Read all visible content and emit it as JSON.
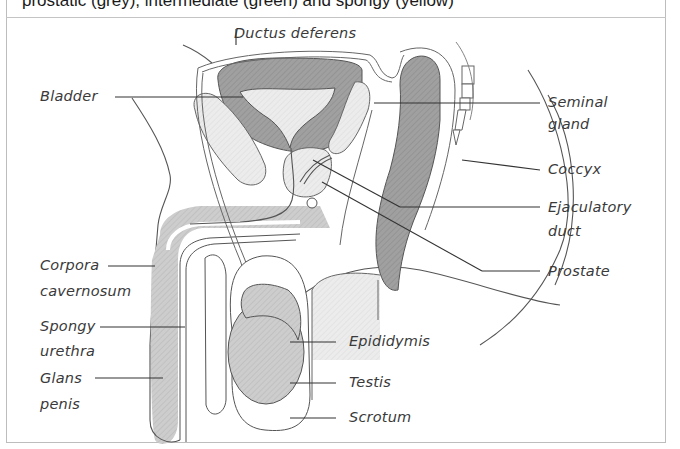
{
  "caption": "prostatic (grey), intermediate (green) and spongy (yellow)",
  "colors": {
    "stroke": "#4a4a4a",
    "dark_fill": "#9a9a9a",
    "mid_fill": "#c8c8c8",
    "light_fill": "#e4e4e4",
    "border": "#bdbdbd"
  },
  "labels": {
    "ductus_deferens": "Ductus deferens",
    "bladder": "Bladder",
    "seminal_gland_1": "Seminal",
    "seminal_gland_2": "gland",
    "coccyx": "Coccyx",
    "ejaculatory_duct_1": "Ejaculatory",
    "ejaculatory_duct_2": "duct",
    "prostate": "Prostate",
    "corpora_cavernosum_1": "Corpora",
    "corpora_cavernosum_2": "cavernosum",
    "spongy_urethra_1": "Spongy",
    "spongy_urethra_2": "urethra",
    "glans_penis_1": "Glans",
    "glans_penis_2": "penis",
    "epididymis": "Epididymis",
    "testis": "Testis",
    "scrotum": "Scrotum"
  }
}
